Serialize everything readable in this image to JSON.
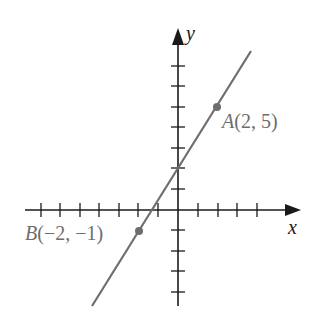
{
  "diagram": {
    "type": "coordinate-plane-line",
    "axes": {
      "x_label": "x",
      "y_label": "y",
      "x_ticks_negative": 7,
      "x_ticks_positive": 4,
      "y_ticks_positive": 7,
      "y_ticks_negative": 4
    },
    "points": [
      {
        "name": "A",
        "label_letter": "A",
        "label_coords": "(2, 5)",
        "x": 2,
        "y": 5
      },
      {
        "name": "B",
        "label_letter": "B",
        "label_coords": "(−2, −1)",
        "x": -2,
        "y": -1
      }
    ],
    "line": {
      "slope": 1.5,
      "y_intercept": 2,
      "color": "#6d6d6d"
    },
    "colors": {
      "axis": "#1a1a1a",
      "line": "#6d6d6d",
      "point": "#6d6d6d",
      "point_label": "#6d6d6d"
    }
  }
}
